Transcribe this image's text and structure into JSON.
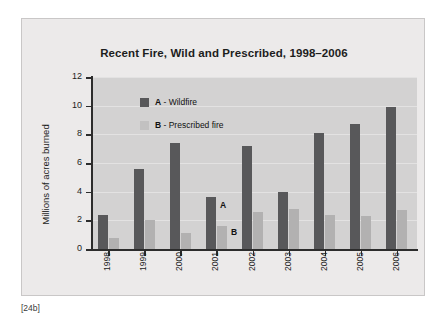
{
  "figure": {
    "caption": "[24b]",
    "frame_bg": "#eceaea",
    "plot_bg": "#d3d2d2"
  },
  "chart_data": {
    "type": "bar",
    "title": "Recent Fire, Wild and Prescribed, 1998–2006",
    "xlabel": "",
    "ylabel": "Millions of acres burned",
    "ylim": [
      0,
      12
    ],
    "yticks": [
      0,
      2,
      4,
      6,
      8,
      10,
      12
    ],
    "ytick_labels": [
      "0",
      "2",
      "4",
      "6",
      "8",
      "10",
      "12"
    ],
    "grid": true,
    "grid_axis": "y",
    "legend_position": "upper-left-inside",
    "categories": [
      "1998",
      "1999",
      "2000",
      "2001",
      "2002",
      "2003",
      "2004",
      "2005",
      "2006"
    ],
    "series": [
      {
        "name": "A - Wildfire",
        "key": "A",
        "label": "Wildfire",
        "color": "#58585a",
        "values": [
          2.4,
          5.6,
          7.4,
          3.6,
          7.2,
          4.0,
          8.1,
          8.7,
          9.9
        ]
      },
      {
        "name": "B - Prescribed fire",
        "key": "B",
        "label": "Prescribed fire",
        "color": "#b2b1b1",
        "values": [
          0.8,
          2.0,
          1.1,
          1.6,
          2.6,
          2.8,
          2.4,
          2.3,
          2.7
        ]
      }
    ],
    "annotations": [
      {
        "text": "A",
        "category": "2001",
        "series": "A"
      },
      {
        "text": "B",
        "category": "2001",
        "series": "B"
      }
    ]
  }
}
